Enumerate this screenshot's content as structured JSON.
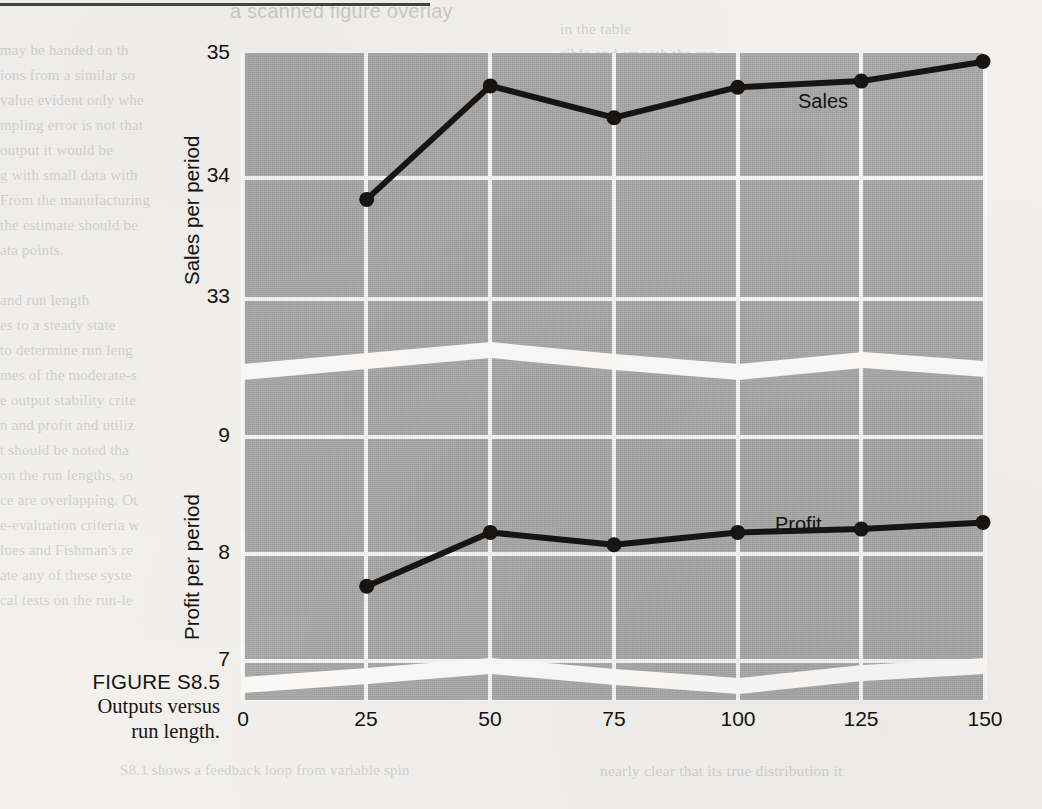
{
  "figure": {
    "caption_number": "FIGURE S8.5",
    "caption_text_line1": "Outputs versus",
    "caption_text_line2": "run length."
  },
  "chart_data": {
    "type": "line",
    "title": "Outputs versus run length.",
    "xlabel": "",
    "x": [
      25,
      50,
      75,
      100,
      125,
      150
    ],
    "x_ticks": [
      "0",
      "25",
      "50",
      "75",
      "100",
      "125",
      "150"
    ],
    "x_tick_values": [
      0,
      25,
      50,
      75,
      100,
      125,
      150
    ],
    "xlim": [
      0,
      150
    ],
    "grid": true,
    "legend": "inline-labels",
    "broken_axis": true,
    "panel_color": "#a9a9a9",
    "grid_color": "#fbfaf8",
    "line_color": "#171411",
    "series": [
      {
        "name": "Sales",
        "label": "Sales",
        "ylabel": "Sales per period",
        "axis": "upper",
        "y_ticks": [
          "35",
          "34",
          "33"
        ],
        "y_tick_values": [
          35,
          34,
          33
        ],
        "ylim": [
          32.7,
          35.0
        ],
        "values": [
          33.8,
          34.73,
          34.47,
          34.72,
          34.77,
          34.93
        ]
      },
      {
        "name": "Profit",
        "label": "Profit",
        "ylabel": "Profit per period",
        "axis": "lower",
        "y_ticks": [
          "9",
          "8",
          "7"
        ],
        "y_tick_values": [
          9,
          8,
          7
        ],
        "ylim": [
          6.6,
          9.2
        ],
        "values": [
          7.65,
          8.13,
          8.02,
          8.13,
          8.16,
          8.22
        ]
      }
    ]
  },
  "background_text": {
    "left_column": [
      "may be needed or the",
      "ieve a specified precision.",
      "value evident only when",
      "impling error is not that",
      "the output is would be",
      "g with a small data set,",
      "From the manufacturer's contract",
      "ure a confident decision be based on these"
    ],
    "left_column_lower": [
      "and run length",
      "s to a steady state",
      "to determine run length",
      "mes of the moderate-term",
      "output stability criteria",
      "r-run profit and utilization",
      "should be noted that the",
      "on the run lengths, so the",
      "e are overlapping. Other",
      "e-evaluation criteria which",
      "ues and Fishman's relative",
      "e any of these systems,",
      "cal tests on the run-length"
    ],
    "right_column": [
      "in the table",
      "sible and smooth the ran-",
      "ess variation is observed,",
      "the simulation model is",
      "ation run is complete.",
      "necessary to understand",
      "e configuration and",
      "tions precisely.",
      "l run simulations.",
      "ns requires modeling",
      "ions in the system.",
      "n the production quantity",
      "each of the",
      "ot of simulation output",
      "y distribution of a",
      "two distinct and nearly",
      "on of values in this",
      "the results are not",
      "ed as unreliable",
      "n on the available",
      "on with a Normal distribution",
      "clear that the true distribution is"
    ],
    "bottom_note_left": "S8.1 shows a feedback loop from variable spin",
    "bottom_note_right": "nearly clear that its true distribution it"
  }
}
